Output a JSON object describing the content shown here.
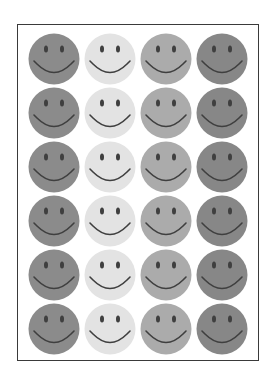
{
  "sheet": {
    "rows": 6,
    "columns": 4,
    "column_colors": [
      "#8b8b8b",
      "#e3e3e3",
      "#ababab",
      "#878787"
    ],
    "feature_color": "#3f3f3f",
    "frame_color": "#3a3a3a",
    "sticker_icon": "smiley-face-icon"
  }
}
